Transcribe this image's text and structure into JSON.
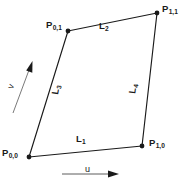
{
  "figure": {
    "background_color": "#ffffff",
    "stroke_color": "#1a1a1a",
    "text_color": "#1a1a1a",
    "width": 191,
    "height": 184
  },
  "vertices": [
    {
      "id": "p00",
      "base": "P",
      "subscript": "0,0",
      "x": 29,
      "y": 157
    },
    {
      "id": "p10",
      "base": "P",
      "subscript": "1,0",
      "x": 142,
      "y": 146
    },
    {
      "id": "p11",
      "base": "P",
      "subscript": "1,1",
      "x": 157,
      "y": 13
    },
    {
      "id": "p01",
      "base": "P",
      "subscript": "0,1",
      "x": 68,
      "y": 31
    }
  ],
  "edges": [
    {
      "id": "l1",
      "base": "L",
      "subscript": "1",
      "from": "p00",
      "to": "p10"
    },
    {
      "id": "l2",
      "base": "L",
      "subscript": "2",
      "from": "p01",
      "to": "p11"
    },
    {
      "id": "l3",
      "base": "L",
      "subscript": "3",
      "from": "p00",
      "to": "p01"
    },
    {
      "id": "l4",
      "base": "L",
      "subscript": "4",
      "from": "p10",
      "to": "p11"
    }
  ],
  "axes": [
    {
      "id": "u",
      "label": "u",
      "direction": "horizontal-right"
    },
    {
      "id": "v",
      "label": "v",
      "direction": "diagonal-up-right"
    }
  ]
}
